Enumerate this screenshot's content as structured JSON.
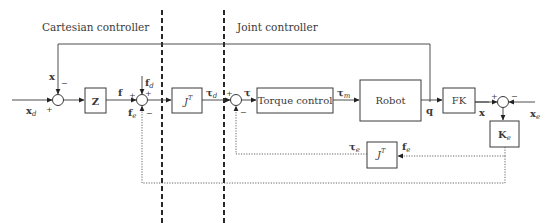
{
  "regions": {
    "cartesian": "Cartesian controller",
    "joint": "Joint controller"
  },
  "blocks": {
    "z": "Z",
    "jt_forward": "J",
    "jt_forward_sup": "T",
    "torque_control": "Torque control",
    "robot": "Robot",
    "fk": "FK",
    "ke": "K",
    "ke_sub": "e",
    "jt_feedback": "J",
    "jt_feedback_sup": "T"
  },
  "signals": {
    "x_feedback": "x",
    "x_d": "x",
    "x_d_sub": "d",
    "f": "f",
    "f_d": "f",
    "f_d_sub": "d",
    "f_e_left": "f",
    "f_e_left_sub": "e",
    "tau_d": "τ",
    "tau_d_sub": "d",
    "tau": "τ",
    "tau_m": "τ",
    "tau_m_sub": "m",
    "q": "q",
    "x_out": "x",
    "x_e": "x",
    "x_e_sub": "e",
    "tau_e": "τ",
    "tau_e_sub": "e",
    "f_e_right": "f",
    "f_e_right_sub": "e"
  },
  "signs": {
    "s1_top": "−",
    "s1_left": "+",
    "s2_left": "+",
    "s2_top": "+",
    "s2_bottom": "−",
    "s3_left": "+",
    "s3_bottom": "−",
    "s4_left": "+",
    "s4_right": "−"
  }
}
